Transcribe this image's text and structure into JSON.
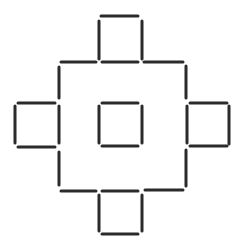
{
  "diagram": {
    "title": "",
    "type": "matchstick-puzzle",
    "stick_color": "#2b2b2b",
    "background": "#ffffff",
    "stick_width": 3,
    "stick_count": 32,
    "sticks": [
      {
        "id": "top-sq-top",
        "x1": 101,
        "y1": 16,
        "x2": 138,
        "y2": 16
      },
      {
        "id": "top-sq-left",
        "x1": 99,
        "y1": 21,
        "x2": 99,
        "y2": 59
      },
      {
        "id": "top-sq-right",
        "x1": 142,
        "y1": 21,
        "x2": 142,
        "y2": 59
      },
      {
        "id": "row1-left",
        "x1": 61,
        "y1": 62,
        "x2": 96,
        "y2": 62
      },
      {
        "id": "row1-mid",
        "x1": 102,
        "y1": 62,
        "x2": 138,
        "y2": 62
      },
      {
        "id": "row1-right",
        "x1": 144,
        "y1": 62,
        "x2": 183,
        "y2": 62
      },
      {
        "id": "outer-left-upper",
        "x1": 59,
        "y1": 67,
        "x2": 59,
        "y2": 98
      },
      {
        "id": "outer-right-upper",
        "x1": 186,
        "y1": 66,
        "x2": 186,
        "y2": 98
      },
      {
        "id": "left-sq-top",
        "x1": 18,
        "y1": 103,
        "x2": 55,
        "y2": 103
      },
      {
        "id": "left-sq-left",
        "x1": 15,
        "y1": 106,
        "x2": 15,
        "y2": 143
      },
      {
        "id": "left-sq-right",
        "x1": 59,
        "y1": 106,
        "x2": 59,
        "y2": 143
      },
      {
        "id": "left-sq-bottom",
        "x1": 18,
        "y1": 147,
        "x2": 55,
        "y2": 147
      },
      {
        "id": "center-sq-top",
        "x1": 102,
        "y1": 103,
        "x2": 138,
        "y2": 103
      },
      {
        "id": "center-sq-left",
        "x1": 99,
        "y1": 106,
        "x2": 99,
        "y2": 143
      },
      {
        "id": "center-sq-right",
        "x1": 142,
        "y1": 106,
        "x2": 142,
        "y2": 143
      },
      {
        "id": "center-sq-bottom",
        "x1": 102,
        "y1": 146,
        "x2": 138,
        "y2": 146
      },
      {
        "id": "right-sq-top",
        "x1": 190,
        "y1": 103,
        "x2": 227,
        "y2": 103
      },
      {
        "id": "right-sq-left",
        "x1": 187,
        "y1": 106,
        "x2": 187,
        "y2": 143
      },
      {
        "id": "right-sq-right",
        "x1": 229,
        "y1": 106,
        "x2": 229,
        "y2": 144
      },
      {
        "id": "right-sq-bottom",
        "x1": 190,
        "y1": 146,
        "x2": 227,
        "y2": 146
      },
      {
        "id": "outer-left-lower",
        "x1": 59,
        "y1": 152,
        "x2": 59,
        "y2": 185
      },
      {
        "id": "outer-right-lower",
        "x1": 186,
        "y1": 150,
        "x2": 186,
        "y2": 186
      },
      {
        "id": "row2-left",
        "x1": 61,
        "y1": 191,
        "x2": 96,
        "y2": 191
      },
      {
        "id": "row2-mid",
        "x1": 102,
        "y1": 191,
        "x2": 138,
        "y2": 191
      },
      {
        "id": "row2-right",
        "x1": 145,
        "y1": 190,
        "x2": 183,
        "y2": 190
      },
      {
        "id": "bottom-sq-left",
        "x1": 99,
        "y1": 195,
        "x2": 99,
        "y2": 231
      },
      {
        "id": "bottom-sq-right",
        "x1": 142,
        "y1": 195,
        "x2": 142,
        "y2": 231
      },
      {
        "id": "bottom-sq-bottom",
        "x1": 102,
        "y1": 234,
        "x2": 138,
        "y2": 234
      }
    ]
  }
}
